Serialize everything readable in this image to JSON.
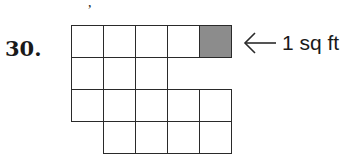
{
  "problem": {
    "number_label": "30.",
    "stray_mark": ","
  },
  "figure": {
    "unit_label": "1 sq ft",
    "arrow_icon": "left-arrow-icon",
    "colors": {
      "line": "#2a2a2a",
      "shaded_cell": "#8c8c8c",
      "background": "#ffffff"
    },
    "grid": {
      "origin_x": 71,
      "origin_y": 25,
      "cell_size": 32,
      "rows": [
        {
          "row": 0,
          "cols": [
            0,
            1,
            2,
            3,
            4
          ],
          "shaded": [
            4
          ]
        },
        {
          "row": 1,
          "cols": [
            0,
            1,
            2
          ],
          "shaded": []
        },
        {
          "row": 2,
          "cols": [
            0,
            1,
            2,
            3,
            4
          ],
          "shaded": []
        },
        {
          "row": 3,
          "cols": [
            1,
            2,
            3,
            4
          ],
          "shaded": [],
          "cut_off": true
        }
      ]
    }
  }
}
